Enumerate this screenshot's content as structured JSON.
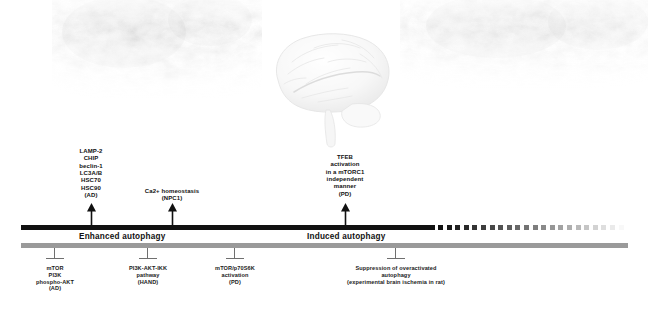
{
  "imagery": {
    "brain_icon": "brain-illustration",
    "tissue_left_icon": "brain-tissue-texture-left",
    "tissue_right_icon": "brain-tissue-texture-right"
  },
  "bars": {
    "enhanced": {
      "label": "Enhanced autophagy",
      "color": "#111111"
    },
    "induced": {
      "label": "Induced autophagy",
      "color": "#111111"
    },
    "suppression_bar": {
      "color": "#9a9a9a"
    }
  },
  "activators": [
    {
      "id": "lamp2-group",
      "x": 91,
      "text": "LAMP-2\nCHIP\nbeclin-1\nLC3A/B\nHSC70\nHSC90\n(AD)",
      "disease": "AD"
    },
    {
      "id": "ca-homeostasis",
      "x": 172,
      "text": "Ca2+ homeostasis\n(NPC1)",
      "disease": "NPC1"
    },
    {
      "id": "tfeb-activation",
      "x": 345,
      "text": "TFEB\nactivation\nin a  mTORC1\nindependent\nmanner\n(PD)",
      "disease": "PD"
    }
  ],
  "inhibitors": [
    {
      "id": "mtor-pi3k-akt",
      "x": 55,
      "text": "mTOR\nPI3K\nphospho-AKT\n(AD)",
      "disease": "AD"
    },
    {
      "id": "pi3k-akt-ikk",
      "x": 148,
      "text": "PI3K-AKT-IKK\npathway\n(HAND)",
      "disease": "HAND"
    },
    {
      "id": "mtor-p70s6k",
      "x": 235,
      "text": "mTOR/p70S6K\nactivation\n(PD)",
      "disease": "PD"
    },
    {
      "id": "suppression-overactivated",
      "x": 396,
      "text": "Suppression of overactivated\nautophagy\n(experimental brain ischemia in rat)",
      "disease": "experimental brain ischemia in rat"
    }
  ],
  "colors": {
    "bar_black": "#111111",
    "bar_gray": "#9a9a9a",
    "text": "#111111",
    "marker_gray": "#6f6f6f"
  }
}
